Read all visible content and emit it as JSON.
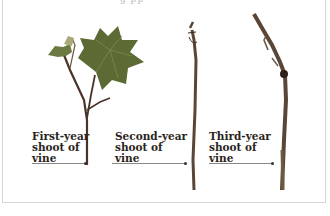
{
  "figure": {
    "top_caption_fragment": "g    pp",
    "specimens": [
      {
        "label_lines": [
          "First-year",
          "shoot of",
          "vine"
        ],
        "description": "first-year-shoot-with-leaves"
      },
      {
        "label_lines": [
          "Second-year",
          "shoot of",
          "vine"
        ],
        "description": "second-year-bare-cane"
      },
      {
        "label_lines": [
          "Third-year",
          "shoot of",
          "vine"
        ],
        "description": "third-year-branched-cane"
      }
    ],
    "colors": {
      "leaf": "#5c6a34",
      "leaf_light": "#7d8a4a",
      "stem": "#4a3328",
      "cane": "#5a4636",
      "label_text": "#2a2420",
      "border": "#d6d6d6"
    }
  }
}
